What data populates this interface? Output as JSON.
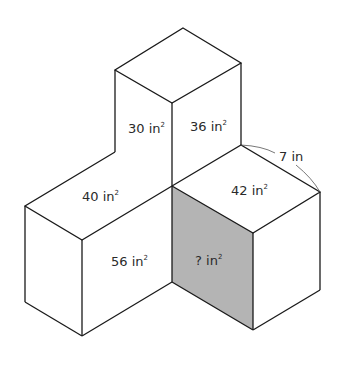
{
  "diagram": {
    "type": "isometric-cuboid-arrangement",
    "unknown_face_fill": "#b4b4b4",
    "line_color": "#1a1a1a",
    "faces": [
      {
        "id": "top-box-left-face",
        "value": "30",
        "unit": "in",
        "exponent": "2"
      },
      {
        "id": "top-box-right-face",
        "value": "36",
        "unit": "in",
        "exponent": "2"
      },
      {
        "id": "left-box-top-face",
        "value": "40",
        "unit": "in",
        "exponent": "2"
      },
      {
        "id": "right-box-top-face",
        "value": "42",
        "unit": "in",
        "exponent": "2"
      },
      {
        "id": "left-box-right-face",
        "value": "56",
        "unit": "in",
        "exponent": "2"
      },
      {
        "id": "right-box-left-face-shaded",
        "value": "?",
        "unit": "in",
        "exponent": "2"
      }
    ],
    "dimension": {
      "value": "7",
      "unit": "in",
      "label": "7 in"
    }
  }
}
